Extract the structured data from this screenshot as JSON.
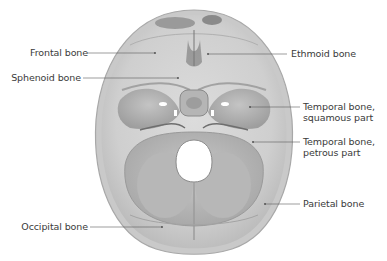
{
  "figure": {
    "colors": {
      "background": "#ffffff",
      "bone_light": "#d9d9d9",
      "bone_mid": "#bdbdbd",
      "bone_dark": "#8f8f8f",
      "label_text": "#3a3a3a",
      "leader_line": "#5a5a5a"
    },
    "labels": [
      {
        "id": "frontal",
        "text": "Frontal bone",
        "side": "left"
      },
      {
        "id": "sphenoid",
        "text": "Sphenoid bone",
        "side": "left"
      },
      {
        "id": "occipital",
        "text": "Occipital bone",
        "side": "left"
      },
      {
        "id": "ethmoid",
        "text": "Ethmoid bone",
        "side": "right"
      },
      {
        "id": "temporal_squamous",
        "line1": "Temporal bone,",
        "line2": "squamous part",
        "side": "right"
      },
      {
        "id": "temporal_petrous",
        "line1": "Temporal bone,",
        "line2": "petrous part",
        "side": "right"
      },
      {
        "id": "parietal",
        "text": "Parietal bone",
        "side": "right"
      }
    ]
  }
}
